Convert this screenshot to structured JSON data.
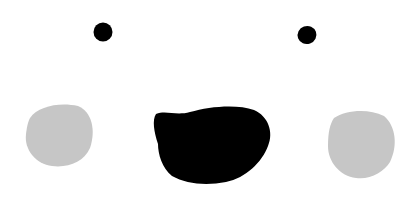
{
  "scene": {
    "description": "Minimal cartoon face: two eyes, open mouth, two cheeks",
    "background": "#ffffff",
    "colors": {
      "eyes": "#000000",
      "mouth": "#000000",
      "cheeks": "#c6c6c6"
    }
  }
}
